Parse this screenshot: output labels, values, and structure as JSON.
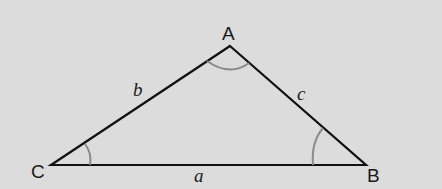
{
  "diagram": {
    "type": "triangle",
    "background": "#dcdcdc",
    "line_color": "#111111",
    "arc_color": "#8a8a8a",
    "vertices": [
      {
        "label": "A",
        "x": 230,
        "y": 46
      },
      {
        "label": "B",
        "x": 366,
        "y": 165
      },
      {
        "label": "C",
        "x": 51,
        "y": 165
      }
    ],
    "sides": [
      {
        "label": "a",
        "between": "B-C"
      },
      {
        "label": "b",
        "between": "C-A"
      },
      {
        "label": "c",
        "between": "A-B"
      }
    ],
    "angle_arcs": [
      "A",
      "B",
      "C"
    ]
  }
}
